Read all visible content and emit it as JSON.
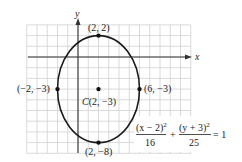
{
  "diagram": {
    "type": "ellipse-graph",
    "axes": {
      "x_label": "x",
      "y_label": "y",
      "x_range": [
        -5,
        11
      ],
      "y_range": [
        -9,
        3
      ],
      "grid": true
    },
    "ellipse": {
      "center": [
        2,
        -3
      ],
      "a_horizontal": 4,
      "b_vertical": 5,
      "stroke_color": "#1a1a1a"
    },
    "points": [
      {
        "name": "top-vertex",
        "coords": [
          2,
          2
        ],
        "label": "(2, 2)"
      },
      {
        "name": "bottom-vertex",
        "coords": [
          2,
          -8
        ],
        "label": "(2, −8)"
      },
      {
        "name": "left-vertex",
        "coords": [
          -2,
          -3
        ],
        "label": "(−2, −3)"
      },
      {
        "name": "right-vertex",
        "coords": [
          6,
          -3
        ],
        "label": "(6, −3)"
      },
      {
        "name": "center",
        "coords": [
          2,
          -3
        ],
        "label_prefix": "C",
        "label": "(2, −3)"
      }
    ],
    "equation": {
      "term1_numerator": "(x − 2)",
      "term1_exp": "2",
      "term1_denominator": "16",
      "plus": "+",
      "term2_numerator": "(y + 3)",
      "term2_exp": "2",
      "term2_denominator": "25",
      "equals": "= 1"
    },
    "colors": {
      "grid": "#d0d0d0",
      "axis": "#333333",
      "curve": "#1a1a1a",
      "point": "#111111"
    }
  }
}
